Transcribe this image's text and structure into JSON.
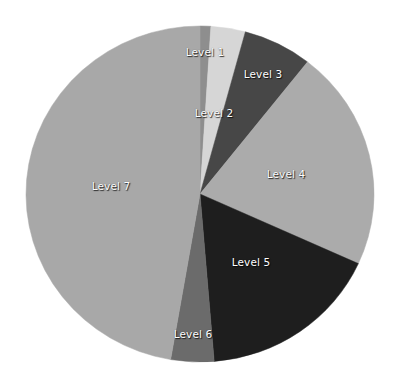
{
  "chart_data": {
    "type": "pie",
    "title": "",
    "start_angle_deg": 0,
    "direction": "clockwise",
    "categories": [
      "Level 1",
      "Level 2",
      "Level 3",
      "Level 4",
      "Level 5",
      "Level 6",
      "Level 7"
    ],
    "values": [
      1.0,
      3.2,
      6.4,
      21.2,
      16.9,
      4.0,
      47.3
    ],
    "colors": [
      "#8e8e8e",
      "#d6d6d6",
      "#474747",
      "#ababab",
      "#1e1e1e",
      "#6b6b6b",
      "#a8a8a8"
    ],
    "label_positions": [
      [
        205,
        52
      ],
      [
        214,
        113
      ],
      [
        263,
        74
      ],
      [
        286,
        174
      ],
      [
        251,
        262
      ],
      [
        193,
        334
      ],
      [
        111,
        186
      ]
    ],
    "legend": "none",
    "data_labels": "category name inside slice"
  },
  "geometry": {
    "cx": 200,
    "cy": 194,
    "rx": 174,
    "ry": 168
  },
  "labels": {
    "l1": "Level 1",
    "l2": "Level 2",
    "l3": "Level 3",
    "l4": "Level 4",
    "l5": "Level 5",
    "l6": "Level 6",
    "l7": "Level 7"
  }
}
